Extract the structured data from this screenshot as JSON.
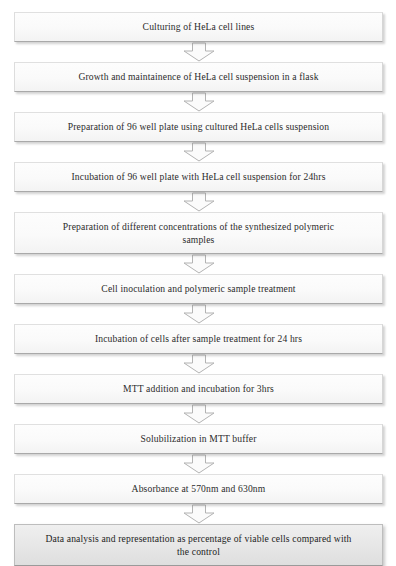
{
  "diagram": {
    "type": "vertical-flowchart",
    "background_color": "#ffffff",
    "box_fill_color": "#fafafa",
    "box_border_color": "#cfcfcf",
    "emphasis_box_fill_color": "#e7e7e7",
    "arrow_fill_color": "#fbfbfb",
    "arrow_stroke_color": "#b3b3b3",
    "text_color": "#2b2b2b",
    "connector_icon": "down-arrow-icon",
    "step_count": 11,
    "steps": [
      {
        "index": 1,
        "label": "Culturing of HeLa cell lines",
        "lines": 1,
        "emphasis": false
      },
      {
        "index": 2,
        "label": "Growth and maintainence of HeLa cell suspension in a flask",
        "lines": 1,
        "emphasis": false
      },
      {
        "index": 3,
        "label": "Preparation of 96 well plate using cultured HeLa cells suspension",
        "lines": 1,
        "emphasis": false
      },
      {
        "index": 4,
        "label": "Incubation of 96 well plate with HeLa cell suspension for 24hrs",
        "lines": 1,
        "emphasis": false
      },
      {
        "index": 5,
        "label": "Preparation of  different concentrations of the synthesized polymeric\nsamples",
        "lines": 2,
        "emphasis": false
      },
      {
        "index": 6,
        "label": "Cell inoculation and polymeric sample treatment",
        "lines": 1,
        "emphasis": false
      },
      {
        "index": 7,
        "label": "Incubation of cells after sample treatment for 24 hrs",
        "lines": 1,
        "emphasis": false
      },
      {
        "index": 8,
        "label": "MTT addition and incubation for 3hrs",
        "lines": 1,
        "emphasis": false
      },
      {
        "index": 9,
        "label": "Solubilization in MTT buffer",
        "lines": 1,
        "emphasis": false
      },
      {
        "index": 10,
        "label": "Absorbance at 570nm and 630nm",
        "lines": 1,
        "emphasis": false
      },
      {
        "index": 11,
        "label": "Data analysis and representation as percentage of viable cells compared with\nthe control",
        "lines": 2,
        "emphasis": true
      }
    ]
  }
}
